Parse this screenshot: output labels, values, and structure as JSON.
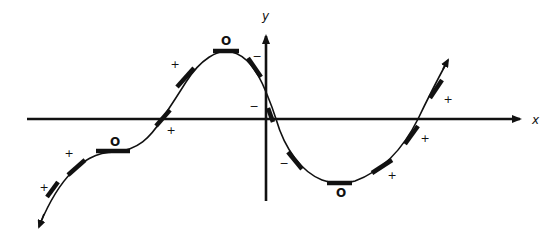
{
  "figure": {
    "type": "function-graph-slope-diagram",
    "colors": {
      "ink": "#111111",
      "background": "#ffffff"
    }
  },
  "axes": {
    "x_label": "x",
    "y_label": "y"
  },
  "slope_markers": [
    {
      "id": "m1",
      "sign": "+",
      "label_pos": [
        44,
        191
      ],
      "seg": [
        [
          47,
          197
        ],
        [
          58,
          182
        ]
      ]
    },
    {
      "id": "m2",
      "sign": "+",
      "label_pos": [
        69,
        157
      ],
      "seg": [
        [
          68,
          175
        ],
        [
          85,
          160
        ]
      ]
    },
    {
      "id": "m3",
      "sign": "O",
      "label_pos": [
        115,
        146
      ],
      "seg": [
        [
          96,
          151
        ],
        [
          130,
          151
        ]
      ]
    },
    {
      "id": "m4",
      "sign": "+",
      "label_pos": [
        171,
        134
      ],
      "seg": [
        [
          156,
          126
        ],
        [
          170,
          110
        ]
      ]
    },
    {
      "id": "m5",
      "sign": "+",
      "label_pos": [
        175,
        68
      ],
      "seg": [
        [
          177,
          87
        ],
        [
          194,
          68
        ]
      ]
    },
    {
      "id": "m6",
      "sign": "O",
      "label_pos": [
        226,
        45
      ],
      "seg": [
        [
          213,
          51
        ],
        [
          239,
          51
        ]
      ]
    },
    {
      "id": "m7",
      "sign": "−",
      "label_pos": [
        257,
        60
      ],
      "seg": [
        [
          248,
          58
        ],
        [
          261,
          77
        ]
      ]
    },
    {
      "id": "m8",
      "sign": "−",
      "label_pos": [
        254,
        110
      ],
      "seg": [
        [
          268,
          108
        ],
        [
          273,
          122
        ]
      ]
    },
    {
      "id": "m9",
      "sign": "−",
      "label_pos": [
        284,
        167
      ],
      "seg": [
        [
          288,
          152
        ],
        [
          302,
          169
        ]
      ]
    },
    {
      "id": "m10",
      "sign": "O",
      "label_pos": [
        341,
        197
      ],
      "seg": [
        [
          327,
          183
        ],
        [
          352,
          183
        ]
      ]
    },
    {
      "id": "m11",
      "sign": "+",
      "label_pos": [
        392,
        179
      ],
      "seg": [
        [
          372,
          173
        ],
        [
          392,
          160
        ]
      ]
    },
    {
      "id": "m12",
      "sign": "+",
      "label_pos": [
        425,
        142
      ],
      "seg": [
        [
          405,
          144
        ],
        [
          418,
          126
        ]
      ]
    },
    {
      "id": "m13",
      "sign": "+",
      "label_pos": [
        448,
        103
      ],
      "seg": [
        [
          430,
          98
        ],
        [
          442,
          80
        ]
      ]
    }
  ],
  "chart_data": {
    "type": "line",
    "title": "",
    "xlabel": "x",
    "ylabel": "y",
    "grid": false,
    "critical_points": [
      {
        "kind": "horizontal inflection (plateau)",
        "slope": "O",
        "position": "left, below x-axis"
      },
      {
        "kind": "local maximum",
        "slope": "O",
        "position": "left of y-axis, above x-axis"
      },
      {
        "kind": "local minimum",
        "slope": "O",
        "position": "right of y-axis, below x-axis"
      }
    ],
    "slope_signs_left_to_right": [
      "+",
      "+",
      "O",
      "+",
      "+",
      "O",
      "−",
      "−",
      "−",
      "O",
      "+",
      "+",
      "+"
    ]
  }
}
